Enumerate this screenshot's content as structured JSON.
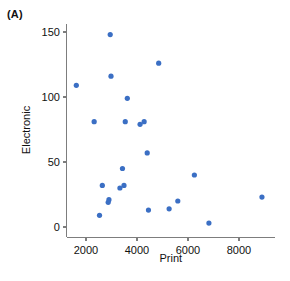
{
  "figure": {
    "panel_label": "(A)",
    "point_color": "#3b6fc4",
    "axis_color": "#7d7d7d"
  },
  "chart_data": {
    "type": "scatter",
    "title": "(A)",
    "xlabel": "Print",
    "ylabel": "Electronic",
    "xlim": [
      1250,
      9400
    ],
    "ylim": [
      -8,
      156
    ],
    "xticks": [
      2000,
      4000,
      6000,
      8000
    ],
    "xtick_labels": [
      "2000",
      "4000",
      "6000",
      "8000"
    ],
    "yticks": [
      0,
      50,
      100,
      150
    ],
    "ytick_labels": [
      "0",
      "50",
      "100",
      "150"
    ],
    "grid": false,
    "legend": null,
    "marker": "circle",
    "marker_color": "#3b6fc4",
    "marker_size": 3,
    "n_points": 23,
    "points": [
      {
        "x": 2950,
        "y": 148
      },
      {
        "x": 4850,
        "y": 126
      },
      {
        "x": 2980,
        "y": 116
      },
      {
        "x": 1620,
        "y": 109
      },
      {
        "x": 3620,
        "y": 99
      },
      {
        "x": 2320,
        "y": 81
      },
      {
        "x": 3540,
        "y": 81
      },
      {
        "x": 4120,
        "y": 79
      },
      {
        "x": 4280,
        "y": 81
      },
      {
        "x": 4400,
        "y": 57
      },
      {
        "x": 3430,
        "y": 45
      },
      {
        "x": 2640,
        "y": 32
      },
      {
        "x": 3330,
        "y": 30
      },
      {
        "x": 3490,
        "y": 32
      },
      {
        "x": 6250,
        "y": 40
      },
      {
        "x": 2900,
        "y": 21
      },
      {
        "x": 2870,
        "y": 19
      },
      {
        "x": 8900,
        "y": 23
      },
      {
        "x": 5600,
        "y": 20
      },
      {
        "x": 5260,
        "y": 14
      },
      {
        "x": 2530,
        "y": 9
      },
      {
        "x": 4450,
        "y": 13
      },
      {
        "x": 6820,
        "y": 3
      }
    ]
  }
}
